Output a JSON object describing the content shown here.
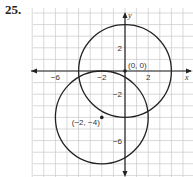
{
  "problem": {
    "number": "25."
  },
  "graph": {
    "origin_px": [
      125,
      71
    ],
    "unit_px": 11.6,
    "x_axis_label": "x",
    "y_axis_label": "y",
    "x_ticks": [
      {
        "value": -6,
        "label": "−6"
      },
      {
        "value": -2,
        "label": "−2"
      },
      {
        "value": 2,
        "label": "2"
      }
    ],
    "y_ticks": [
      {
        "value": 2,
        "label": "2"
      },
      {
        "value": -2,
        "label": "−2"
      },
      {
        "value": -6,
        "label": "−6"
      }
    ],
    "points": [
      {
        "name": "origin",
        "label": "(0, 0)",
        "x": 0,
        "y": 0
      },
      {
        "name": "center-b",
        "label": "(−2, −4)",
        "x": -2,
        "y": -4
      }
    ],
    "circles": [
      {
        "name": "circle-a",
        "cx": 0,
        "cy": 0,
        "r": 4
      },
      {
        "name": "circle-b",
        "cx": -2,
        "cy": -4,
        "r": 4
      }
    ],
    "colors": {
      "grid": "#c8c8c8",
      "curve": "#222222",
      "axis": "#222222"
    }
  }
}
